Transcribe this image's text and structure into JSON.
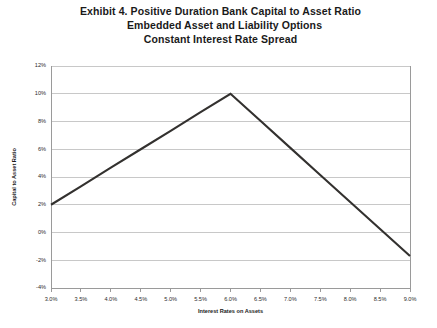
{
  "title": {
    "line1": "Exhibit 4. Positive Duration Bank Capital to Asset Ratio",
    "line2": "Embedded Asset and Liability Options",
    "line3": "Constant Interest Rate Spread"
  },
  "chart_data": {
    "type": "line",
    "title": "Exhibit 4. Positive Duration Bank Capital to Asset Ratio Embedded Asset and Liability Options Constant Interest Rate Spread",
    "xlabel": "Interest Rates on Assets",
    "ylabel": "Capital to Asset Ratio",
    "x": [
      3.0,
      3.5,
      4.0,
      4.5,
      5.0,
      5.5,
      6.0,
      6.5,
      7.0,
      7.5,
      8.0,
      8.5,
      9.0
    ],
    "xtick_labels": [
      "3.0%",
      "3.5%",
      "4.0%",
      "4.5%",
      "5.0%",
      "5.5%",
      "6.0%",
      "6.5%",
      "7.0%",
      "7.5%",
      "8.0%",
      "8.5%",
      "9.0%"
    ],
    "ytick_values": [
      12,
      10,
      8,
      6,
      4,
      2,
      0,
      -2,
      -4
    ],
    "ytick_labels": [
      "12%",
      "10%",
      "8%",
      "6%",
      "4%",
      "2%",
      "0%",
      "-2%",
      "-4%"
    ],
    "xlim": [
      3.0,
      9.0
    ],
    "ylim": [
      -4,
      12
    ],
    "grid": "horizontal",
    "legend": "none",
    "series": [
      {
        "name": "Capital to Asset Ratio",
        "color": "#33312f",
        "values": [
          2.0,
          3.33,
          4.67,
          6.0,
          7.33,
          8.67,
          10.0,
          8.05,
          6.1,
          4.15,
          2.2,
          0.25,
          -1.7
        ]
      }
    ]
  }
}
